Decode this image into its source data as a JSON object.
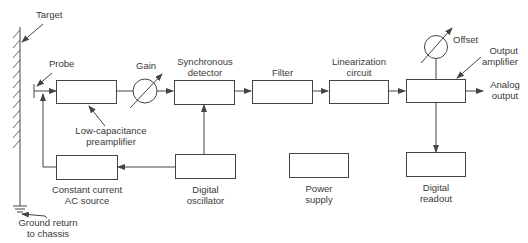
{
  "diagram": {
    "type": "block-diagram",
    "labels": {
      "target": "Target",
      "probe": "Probe",
      "gain": "Gain",
      "sync_detector_1": "Synchronous",
      "sync_detector_2": "detector",
      "filter": "Filter",
      "linearization_1": "Linearization",
      "linearization_2": "circuit",
      "offset": "Offset",
      "output_amp_1": "Output",
      "output_amp_2": "amplifier",
      "analog_output_1": "Analog",
      "analog_output_2": "output",
      "preamp_1": "Low-capacitance",
      "preamp_2": "preamplifier",
      "ccs_1": "Constant current",
      "ccs_2": "AC source",
      "oscillator_1": "Digital",
      "oscillator_2": "oscillator",
      "power_1": "Power",
      "power_2": "supply",
      "readout_1": "Digital",
      "readout_2": "readout",
      "ground_1": "Ground return",
      "ground_2": "to chassis"
    },
    "blocks": [
      {
        "id": "preamp",
        "name": "Low-capacitance preamplifier"
      },
      {
        "id": "sync_detector",
        "name": "Synchronous detector"
      },
      {
        "id": "filter",
        "name": "Filter"
      },
      {
        "id": "linearization",
        "name": "Linearization circuit"
      },
      {
        "id": "output_amp",
        "name": "Output amplifier"
      },
      {
        "id": "ccs",
        "name": "Constant current AC source"
      },
      {
        "id": "oscillator",
        "name": "Digital oscillator"
      },
      {
        "id": "power",
        "name": "Power supply"
      },
      {
        "id": "readout",
        "name": "Digital readout"
      }
    ],
    "connections": [
      [
        "probe",
        "preamp"
      ],
      [
        "preamp",
        "gain"
      ],
      [
        "gain",
        "sync_detector"
      ],
      [
        "sync_detector",
        "filter"
      ],
      [
        "filter",
        "linearization"
      ],
      [
        "linearization",
        "output_amp"
      ],
      [
        "output_amp",
        "analog_output"
      ],
      [
        "offset",
        "output_amp"
      ],
      [
        "output_amp",
        "readout"
      ],
      [
        "oscillator",
        "sync_detector"
      ],
      [
        "oscillator",
        "ccs"
      ],
      [
        "ccs",
        "probe"
      ]
    ]
  }
}
